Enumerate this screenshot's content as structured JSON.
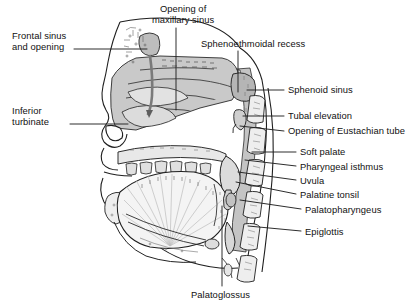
{
  "figure": {
    "type": "anatomical-diagram",
    "view": "sagittal (side profile, facing left)",
    "style": "line drawing with gray tonal shading",
    "background_color": "#ffffff",
    "line_color": "#1a1a1a",
    "cavity_fill": "#c9c9c9",
    "soft_tissue_fill": "#e4e4e4",
    "bone_fill": "#f2f2f2",
    "leader_line_color": "#222222"
  },
  "labels": {
    "frontal_sinus": {
      "text": "Frontal sinus\nand opening",
      "side": "left",
      "x": 12,
      "y": 30,
      "leader": [
        [
          74,
          49
        ],
        [
          147,
          49
        ]
      ]
    },
    "inferior_turbinate": {
      "text": "Inferior\nturbinate",
      "side": "left",
      "x": 12,
      "y": 105,
      "leader": [
        [
          70,
          124
        ],
        [
          128,
          124
        ]
      ]
    },
    "opening_maxillary_sinus": {
      "text": "Opening of\nmaxillary sinus",
      "side": "top",
      "x": 152,
      "y": 3,
      "leader": [
        [
          176,
          28
        ],
        [
          176,
          110
        ]
      ]
    },
    "sphenoethmoidal_recess": {
      "text": "Sphenoethmoidal recess",
      "side": "top",
      "x": 201,
      "y": 38,
      "leader": [
        [
          238,
          51
        ],
        [
          238,
          92
        ]
      ]
    },
    "sphenoid_sinus": {
      "text": "Sphenoid sinus",
      "side": "right",
      "x": 288,
      "y": 84,
      "leader": [
        [
          284,
          90
        ],
        [
          247,
          90
        ]
      ]
    },
    "tubal_elevation": {
      "text": "Tubal elevation",
      "side": "right",
      "x": 288,
      "y": 110,
      "leader": [
        [
          284,
          116
        ],
        [
          243,
          116
        ]
      ]
    },
    "opening_eustachian_tube": {
      "text": "Opening of Eustachian tube",
      "side": "right",
      "x": 288,
      "y": 125,
      "leader": [
        [
          284,
          131
        ],
        [
          240,
          126
        ]
      ]
    },
    "soft_palate": {
      "text": "Soft palate",
      "side": "right",
      "x": 300,
      "y": 146,
      "leader": [
        [
          296,
          152
        ],
        [
          252,
          152
        ]
      ]
    },
    "pharyngeal_isthmus": {
      "text": "Pharyngeal isthmus",
      "side": "right",
      "x": 300,
      "y": 161,
      "leader": [
        [
          296,
          166
        ],
        [
          245,
          160
        ]
      ]
    },
    "uvula": {
      "text": "Uvula",
      "side": "right",
      "x": 300,
      "y": 175,
      "leader": [
        [
          296,
          180
        ],
        [
          238,
          172
        ]
      ]
    },
    "palatine_tonsil": {
      "text": "Palatine tonsil",
      "side": "right",
      "x": 300,
      "y": 189,
      "leader": [
        [
          296,
          194
        ],
        [
          236,
          182
        ]
      ]
    },
    "palatopharyngeus": {
      "text": "Palatopharyngeus",
      "side": "right",
      "x": 305,
      "y": 204,
      "leader": [
        [
          301,
          209
        ],
        [
          240,
          200
        ]
      ]
    },
    "epiglottis": {
      "text": "Epiglottis",
      "side": "right",
      "x": 305,
      "y": 226,
      "leader": [
        [
          301,
          231
        ],
        [
          248,
          226
        ]
      ]
    },
    "palatoglossus": {
      "text": "Palatoglossus",
      "side": "bottom",
      "x": 191,
      "y": 289,
      "leader": [
        [
          222,
          286
        ],
        [
          222,
          206
        ]
      ]
    }
  }
}
